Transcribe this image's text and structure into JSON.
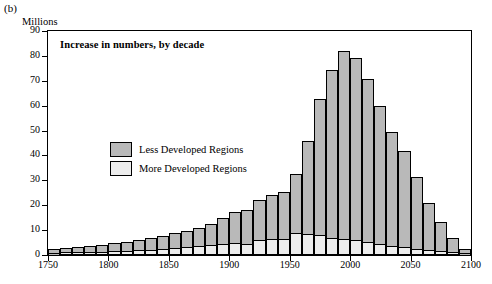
{
  "panel": {
    "label": "(b)"
  },
  "axis": {
    "unit": "Millions"
  },
  "chart_title": "Increase in numbers, by decade",
  "legend": [
    {
      "name": "Less Developed Regions",
      "color": "#b9b9b9"
    },
    {
      "name": "More Developed Regions",
      "color": "#ededed"
    }
  ],
  "chart_data": {
    "type": "bar",
    "title": "Increase in numbers, by decade",
    "subtitle": "(b)",
    "xlabel": "",
    "ylabel": "Millions",
    "xlim": [
      1750,
      2100
    ],
    "ylim": [
      0,
      90
    ],
    "ytick_labels": [
      "0",
      "10",
      "20",
      "30",
      "40",
      "50",
      "60",
      "70",
      "80",
      "90"
    ],
    "ytick_values": [
      0,
      10,
      20,
      30,
      40,
      50,
      60,
      70,
      80,
      90
    ],
    "xtick_labels": [
      "1750",
      "1800",
      "1850",
      "1900",
      "1950",
      "2000",
      "2050",
      "2100"
    ],
    "xtick_values": [
      1750,
      1800,
      1850,
      1900,
      1950,
      2000,
      2050,
      2100
    ],
    "grid": false,
    "legend_position": "inside-left",
    "stacked": true,
    "bar_width_years": 10,
    "categories": [
      1750,
      1760,
      1770,
      1780,
      1790,
      1800,
      1810,
      1820,
      1830,
      1840,
      1850,
      1860,
      1870,
      1880,
      1890,
      1900,
      1910,
      1920,
      1930,
      1940,
      1950,
      1960,
      1970,
      1980,
      1990,
      2000,
      2010,
      2020,
      2030,
      2040,
      2050,
      2060,
      2070,
      2080,
      2090
    ],
    "series": [
      {
        "name": "Less Developed Regions",
        "values": [
          2.0,
          2.2,
          2.6,
          2.8,
          3.0,
          3.6,
          4.0,
          4.4,
          5.0,
          5.6,
          6.4,
          7.0,
          7.8,
          9.0,
          10.5,
          12.6,
          14.0,
          16.5,
          18.0,
          19.5,
          24.0,
          38.0,
          55.0,
          68.0,
          76.0,
          73.5,
          66.0,
          56.0,
          46.0,
          39.0,
          29.0,
          19.5,
          12.0,
          6.0,
          2.0
        ]
      },
      {
        "name": "More Developed Regions",
        "values": [
          0.6,
          0.7,
          0.8,
          0.9,
          1.0,
          1.2,
          1.4,
          1.6,
          1.8,
          2.0,
          2.4,
          2.8,
          3.2,
          3.6,
          4.2,
          4.6,
          4.2,
          5.5,
          6.0,
          6.0,
          8.5,
          8.0,
          7.5,
          6.5,
          6.0,
          5.5,
          4.8,
          4.0,
          3.4,
          2.8,
          2.2,
          1.6,
          1.2,
          0.8,
          0.5
        ]
      }
    ],
    "totals": [
      2.6,
      2.9,
      3.4,
      3.7,
      4.0,
      4.8,
      5.4,
      6.0,
      6.8,
      7.6,
      8.8,
      9.8,
      11.0,
      12.6,
      14.7,
      17.2,
      18.2,
      22.0,
      24.0,
      25.5,
      32.5,
      46.0,
      62.5,
      74.5,
      82.0,
      79.0,
      70.8,
      60.0,
      49.4,
      41.8,
      31.2,
      21.1,
      13.2,
      6.8,
      2.5
    ]
  }
}
